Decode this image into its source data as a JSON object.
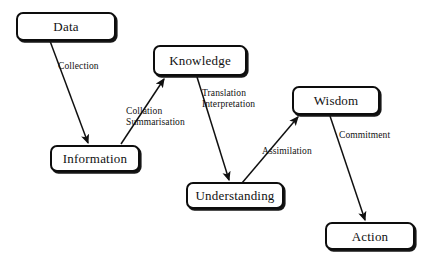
{
  "diagram": {
    "width": 429,
    "height": 261,
    "background_color": "#ffffff",
    "line_color": "#101010",
    "text_color": "#111111",
    "nodes": [
      {
        "id": "data",
        "label": "Data",
        "x": 16,
        "y": 12,
        "w": 100,
        "h": 29
      },
      {
        "id": "knowledge",
        "label": "Knowledge",
        "x": 153,
        "y": 45,
        "w": 94,
        "h": 31
      },
      {
        "id": "information",
        "label": "Information",
        "x": 50,
        "y": 145,
        "w": 90,
        "h": 27
      },
      {
        "id": "wisdom",
        "label": "Wisdom",
        "x": 292,
        "y": 86,
        "w": 88,
        "h": 29
      },
      {
        "id": "understanding",
        "label": "Understanding",
        "x": 186,
        "y": 182,
        "w": 98,
        "h": 27
      },
      {
        "id": "action",
        "label": "Action",
        "x": 325,
        "y": 222,
        "w": 90,
        "h": 28
      }
    ],
    "edges": [
      {
        "id": "collection",
        "from": "data",
        "to": "information",
        "x1": 50,
        "y1": 41,
        "x2": 88,
        "y2": 143
      },
      {
        "id": "collation",
        "from": "information",
        "to": "knowledge",
        "x1": 121,
        "y1": 144,
        "x2": 164,
        "y2": 79
      },
      {
        "id": "translation",
        "from": "knowledge",
        "to": "understanding",
        "x1": 197,
        "y1": 77,
        "x2": 229,
        "y2": 180
      },
      {
        "id": "assimilation",
        "from": "understanding",
        "to": "wisdom",
        "x1": 242,
        "y1": 183,
        "x2": 298,
        "y2": 117
      },
      {
        "id": "commitment",
        "from": "wisdom",
        "to": "action",
        "x1": 330,
        "y1": 116,
        "x2": 365,
        "y2": 220
      }
    ],
    "edge_labels": [
      {
        "id": "collection",
        "text": "Collection",
        "x": 58,
        "y": 61
      },
      {
        "id": "collation",
        "text": "Collation\nSummarisation",
        "x": 126,
        "y": 106
      },
      {
        "id": "translation",
        "text": "Translation\nInterpretation",
        "x": 202,
        "y": 88
      },
      {
        "id": "assimilation",
        "text": "Assimilation",
        "x": 262,
        "y": 146
      },
      {
        "id": "commitment",
        "text": "Commitment",
        "x": 339,
        "y": 130
      }
    ]
  }
}
